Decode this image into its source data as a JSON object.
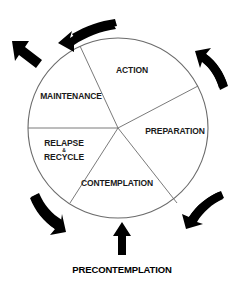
{
  "diagram": {
    "shape": "circle",
    "stages": [
      {
        "id": "action",
        "label": "ACTION",
        "position": {
          "x": 132,
          "y": 70
        }
      },
      {
        "id": "preparation",
        "label": "PREPARATION",
        "position": {
          "x": 175,
          "y": 131
        }
      },
      {
        "id": "contemplation",
        "label": "CONTEMPLATION",
        "position": {
          "x": 117,
          "y": 183
        }
      },
      {
        "id": "relapse-recycle",
        "label_line_1": "RELAPSE",
        "label_ampersand": "&",
        "label_line_2": "RECYCLE",
        "position": {
          "x": 64,
          "y": 150
        }
      },
      {
        "id": "maintenance",
        "label": "MAINTENANCE",
        "position": {
          "x": 71,
          "y": 96
        }
      }
    ],
    "entry_point": {
      "id": "precontemplation",
      "label": "PRECONTEMPLATION",
      "position": {
        "x": 122,
        "y": 269
      }
    },
    "arrows": [
      {
        "id": "arrow-top",
        "direction": "counter-clockwise-curved-left"
      },
      {
        "id": "arrow-top-left-exit",
        "direction": "up-left-straight"
      },
      {
        "id": "arrow-top-right",
        "direction": "up-left-curved"
      },
      {
        "id": "arrow-bottom-right",
        "direction": "up-right-curved"
      },
      {
        "id": "arrow-bottom-left",
        "direction": "down-right-curved"
      },
      {
        "id": "arrow-bottom-entry",
        "direction": "up-straight"
      }
    ],
    "colors": {
      "arrow_fill": "#000000",
      "circle_stroke": "#6b6b6b",
      "spoke_stroke": "#6b6b6b",
      "text": "#1a1a1a",
      "background": "#ffffff"
    }
  }
}
